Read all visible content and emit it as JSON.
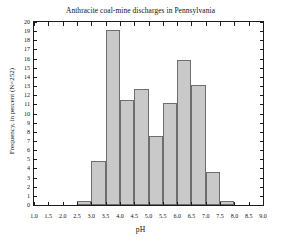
{
  "chart_data": {
    "type": "bar",
    "title": "Anthracite coal-mine discharges in Pennsylvania",
    "xlabel": "pH",
    "ylabel": "Frequency, in percent (N=252)",
    "xlim": [
      1.0,
      9.0
    ],
    "ylim": [
      0,
      20
    ],
    "grid": false,
    "legend": null,
    "bin_width": 0.5,
    "bin_edges": [
      2.5,
      3.0,
      3.5,
      4.0,
      4.5,
      5.0,
      5.5,
      6.0,
      6.5,
      7.0,
      7.5,
      8.0
    ],
    "categories": [
      "2.5-3.0",
      "3.0-3.5",
      "3.5-4.0",
      "4.0-4.5",
      "4.5-5.0",
      "5.0-5.5",
      "5.5-6.0",
      "6.0-6.5",
      "6.5-7.0",
      "7.0-7.5",
      "7.5-8.0"
    ],
    "values": [
      0.4,
      4.8,
      19.1,
      11.5,
      12.7,
      7.5,
      11.1,
      15.9,
      13.1,
      3.6,
      0.4
    ],
    "bars": [
      {
        "x0": 2.5,
        "x1": 3.0,
        "value": 0.4
      },
      {
        "x0": 3.0,
        "x1": 3.5,
        "value": 4.8
      },
      {
        "x0": 3.5,
        "x1": 4.0,
        "value": 19.1
      },
      {
        "x0": 4.0,
        "x1": 4.5,
        "value": 11.5
      },
      {
        "x0": 4.5,
        "x1": 5.0,
        "value": 12.7
      },
      {
        "x0": 5.0,
        "x1": 5.5,
        "value": 7.5
      },
      {
        "x0": 5.5,
        "x1": 6.0,
        "value": 11.1
      },
      {
        "x0": 6.0,
        "x1": 6.5,
        "value": 15.9
      },
      {
        "x0": 6.5,
        "x1": 7.0,
        "value": 13.1
      },
      {
        "x0": 7.0,
        "x1": 7.5,
        "value": 3.6
      },
      {
        "x0": 7.5,
        "x1": 8.0,
        "value": 0.4
      }
    ],
    "x_ticks": [
      "1.0",
      "1.5",
      "2.0",
      "2.5",
      "3.0",
      "3.5",
      "4.0",
      "4.5",
      "5.0",
      "5.5",
      "6.0",
      "6.5",
      "7.0",
      "7.5",
      "8.0",
      "8.5",
      "9.0"
    ],
    "x_tick_values": [
      1.0,
      1.5,
      2.0,
      2.5,
      3.0,
      3.5,
      4.0,
      4.5,
      5.0,
      5.5,
      6.0,
      6.5,
      7.0,
      7.5,
      8.0,
      8.5,
      9.0
    ],
    "y_ticks": [
      "0",
      "1",
      "2",
      "3",
      "4",
      "5",
      "6",
      "7",
      "8",
      "9",
      "10",
      "11",
      "12",
      "13",
      "14",
      "15",
      "16",
      "17",
      "18",
      "19",
      "20"
    ],
    "y_tick_values": [
      0,
      1,
      2,
      3,
      4,
      5,
      6,
      7,
      8,
      9,
      10,
      11,
      12,
      13,
      14,
      15,
      16,
      17,
      18,
      19,
      20
    ],
    "colors": {
      "bar_fill": "#c9c9c9",
      "bar_edge": "#6e6e6e",
      "axis": "#1c1c1c",
      "text": "#111111",
      "background": "#ffffff"
    }
  }
}
